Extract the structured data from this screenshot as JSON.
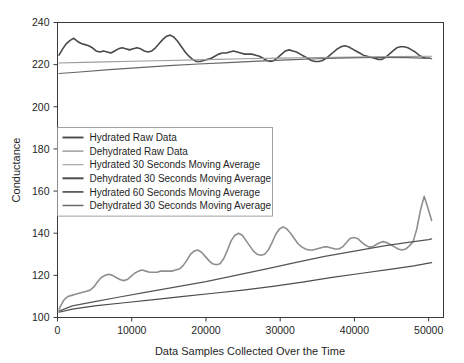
{
  "chart_data": {
    "type": "line",
    "title": "",
    "xlabel": "Data Samples Collected Over the Time",
    "ylabel": "Conductance",
    "xlim": [
      0,
      52000
    ],
    "ylim": [
      100,
      240
    ],
    "xticks": [
      0,
      10000,
      20000,
      30000,
      40000,
      50000
    ],
    "xtick_labels": [
      "0",
      "10000",
      "20000",
      "30000",
      "40000",
      "50000"
    ],
    "yticks": [
      100,
      120,
      140,
      160,
      180,
      200,
      220,
      240
    ],
    "ytick_labels": [
      "100",
      "120",
      "140",
      "160",
      "180",
      "200",
      "220",
      "240"
    ],
    "grid": false,
    "legend_position": "center-left",
    "series": [
      {
        "name": "Hydrated Raw Data",
        "color": "#4a4a4a",
        "width": 1.6,
        "x": [
          200,
          700,
          1200,
          1700,
          2200,
          2700,
          3200,
          3700,
          4200,
          4700,
          5200,
          5700,
          6200,
          6700,
          7200,
          7700,
          8200,
          8700,
          9200,
          9700,
          10200,
          10700,
          11200,
          11700,
          12200,
          12700,
          13200,
          13700,
          14200,
          14700,
          15200,
          15700,
          16200,
          16700,
          17200,
          17700,
          18200,
          18700,
          19200,
          19700,
          20200,
          20700,
          21200,
          21700,
          22200,
          22700,
          23200,
          23700,
          24200,
          24700,
          25200,
          25700,
          26200,
          26700,
          27200,
          27700,
          28200,
          28700,
          29200,
          29700,
          30200,
          30700,
          31200,
          31700,
          32200,
          32700,
          33200,
          33700,
          34200,
          34700,
          35200,
          35700,
          36200,
          36700,
          37200,
          37700,
          38200,
          38700,
          39200,
          39700,
          40200,
          40700,
          41200,
          41700,
          42200,
          42700,
          43200,
          43700,
          44200,
          44700,
          45200,
          45700,
          46200,
          46700,
          47200,
          47700,
          48200,
          48700,
          49200,
          49700,
          50200
        ],
        "y": [
          224.5,
          227.5,
          230.0,
          231.5,
          232.5,
          231.0,
          230.0,
          229.5,
          229.0,
          228.0,
          226.5,
          226.0,
          226.5,
          226.0,
          225.5,
          226.5,
          227.5,
          228.0,
          227.5,
          227.0,
          227.5,
          228.0,
          227.5,
          226.5,
          226.0,
          226.5,
          228.0,
          230.0,
          232.0,
          233.5,
          234.0,
          233.0,
          231.0,
          228.5,
          226.0,
          224.0,
          222.5,
          221.5,
          221.5,
          222.0,
          222.5,
          223.0,
          224.0,
          225.0,
          225.5,
          225.5,
          226.0,
          226.5,
          226.0,
          225.5,
          225.0,
          225.0,
          225.0,
          224.5,
          224.0,
          223.0,
          222.0,
          221.5,
          222.0,
          223.5,
          225.0,
          226.5,
          227.0,
          226.5,
          226.0,
          225.0,
          224.0,
          223.0,
          222.0,
          221.5,
          221.5,
          222.0,
          223.0,
          224.5,
          226.0,
          227.5,
          228.5,
          229.0,
          228.5,
          227.5,
          226.5,
          225.5,
          224.5,
          224.0,
          223.5,
          223.0,
          222.5,
          222.5,
          223.5,
          225.0,
          226.5,
          228.0,
          228.5,
          228.5,
          228.0,
          227.0,
          226.0,
          224.5,
          223.5,
          223.0,
          223.0
        ]
      },
      {
        "name": "Dehydrated Raw Data",
        "color": "#8f8f8f",
        "width": 1.6,
        "x": [
          200,
          500,
          900,
          1400,
          1900,
          2400,
          2900,
          3400,
          3900,
          4400,
          4900,
          5400,
          5900,
          6400,
          6900,
          7400,
          7900,
          8400,
          8900,
          9400,
          9900,
          10400,
          10900,
          11400,
          11900,
          12400,
          12900,
          13400,
          13900,
          14400,
          14900,
          15400,
          15900,
          16400,
          16900,
          17400,
          17900,
          18400,
          18900,
          19400,
          19900,
          20400,
          20900,
          21400,
          21900,
          22400,
          22900,
          23400,
          23900,
          24400,
          24900,
          25400,
          25900,
          26400,
          26900,
          27400,
          27900,
          28400,
          28900,
          29400,
          29900,
          30400,
          30900,
          31400,
          31900,
          32400,
          32900,
          33400,
          33900,
          34400,
          34900,
          35400,
          35900,
          36400,
          36900,
          37400,
          37900,
          38400,
          38900,
          39400,
          39900,
          40400,
          40900,
          41400,
          41900,
          42400,
          42900,
          43400,
          43900,
          44400,
          44900,
          45400,
          45900,
          46400,
          46900,
          47400,
          47900,
          48400,
          48900,
          49400,
          49900,
          50400
        ],
        "y": [
          104.0,
          106.0,
          108.5,
          110.0,
          110.5,
          111.0,
          111.5,
          112.0,
          112.5,
          113.0,
          114.5,
          117.0,
          119.0,
          120.0,
          120.5,
          120.0,
          119.0,
          118.0,
          117.5,
          118.0,
          119.5,
          121.0,
          122.0,
          122.5,
          122.0,
          121.5,
          121.5,
          121.5,
          122.0,
          122.0,
          122.0,
          122.0,
          122.5,
          123.0,
          124.5,
          127.0,
          130.0,
          131.5,
          132.0,
          131.0,
          129.0,
          127.0,
          125.5,
          125.0,
          125.5,
          128.0,
          132.0,
          136.5,
          139.0,
          140.0,
          139.0,
          136.5,
          134.0,
          131.5,
          130.0,
          129.5,
          130.0,
          132.0,
          135.5,
          139.5,
          142.0,
          143.0,
          142.0,
          140.0,
          137.5,
          135.0,
          133.5,
          132.5,
          132.0,
          132.0,
          132.5,
          133.0,
          133.5,
          133.5,
          133.0,
          132.5,
          132.5,
          133.5,
          135.5,
          137.5,
          138.0,
          137.5,
          136.0,
          134.5,
          133.5,
          133.5,
          134.5,
          135.5,
          136.0,
          135.5,
          134.5,
          133.5,
          132.5,
          132.0,
          132.5,
          134.0,
          136.0,
          142.0,
          151.0,
          157.5,
          152.0,
          146.0
        ]
      },
      {
        "name": "Hydrated 30 Seconds Moving Average",
        "color": "#9a9a9a",
        "width": 1.1,
        "x": [
          200,
          5000,
          10000,
          15000,
          20000,
          25000,
          30000,
          35000,
          40000,
          45000,
          50000,
          50400
        ],
        "y": [
          220.8,
          221.2,
          221.6,
          222.0,
          222.4,
          222.8,
          223.1,
          223.4,
          223.6,
          223.8,
          224.0,
          224.0
        ]
      },
      {
        "name": "Dehydrated 30 Seconds Moving Average",
        "color": "#555555",
        "width": 1.2,
        "x": [
          200,
          2000,
          5000,
          8000,
          12000,
          16000,
          20000,
          24000,
          28000,
          32000,
          36000,
          40000,
          44000,
          47000,
          50000,
          50400
        ],
        "y": [
          103.0,
          105.5,
          107.5,
          109.5,
          112.0,
          114.5,
          117.0,
          120.0,
          123.0,
          126.0,
          129.0,
          131.5,
          134.0,
          135.5,
          137.0,
          137.3
        ]
      },
      {
        "name": "Hydrated 60 Seconds Moving Average",
        "color": "#666666",
        "width": 1.2,
        "x": [
          200,
          3000,
          7000,
          11000,
          15000,
          19000,
          23000,
          27000,
          31000,
          35000,
          39000,
          43000,
          47000,
          50000,
          50400
        ],
        "y": [
          215.8,
          216.5,
          217.6,
          218.6,
          219.5,
          220.3,
          221.0,
          221.7,
          222.3,
          222.8,
          223.2,
          223.4,
          223.3,
          223.0,
          222.9
        ]
      },
      {
        "name": "Dehydrated 30 Seconds Moving Average",
        "color": "#4d4d4d",
        "width": 1.2,
        "x": [
          200,
          2000,
          5000,
          9000,
          13000,
          17000,
          21000,
          25000,
          29000,
          33000,
          37000,
          41000,
          45000,
          48000,
          50000,
          50400
        ],
        "y": [
          102.5,
          104.0,
          105.5,
          107.0,
          108.5,
          110.0,
          111.5,
          113.0,
          114.8,
          116.8,
          119.0,
          121.0,
          123.0,
          124.5,
          125.8,
          126.0
        ]
      }
    ]
  },
  "legend": {
    "items": [
      {
        "label": "Hydrated Raw Data",
        "color": "#4a4a4a",
        "width": 1.9
      },
      {
        "label": "Dehydrated Raw Data",
        "color": "#9d9d9d",
        "width": 1.5
      },
      {
        "label": "Hydrated 30 Seconds Moving Average",
        "color": "#a5a5a5",
        "width": 1.2
      },
      {
        "label": "Dehydrated 30 Seconds Moving Average",
        "color": "#4d4d4d",
        "width": 2.0
      },
      {
        "label": "Hydrated 60 Seconds Moving Average",
        "color": "#5c5c5c",
        "width": 1.8
      },
      {
        "label": "Dehydrated 30 Seconds Moving Average",
        "color": "#6a6a6a",
        "width": 1.5
      }
    ]
  }
}
